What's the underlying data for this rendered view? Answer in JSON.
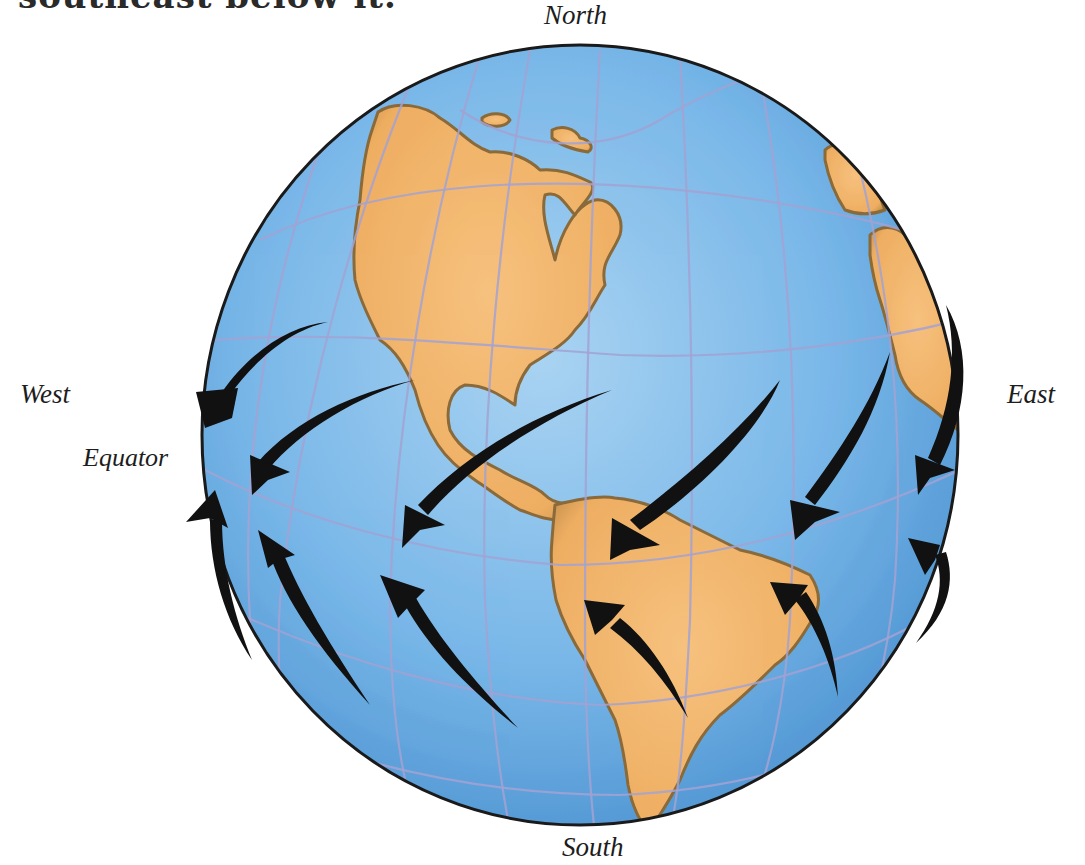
{
  "caption": {
    "top_text_fragment": "southeast below it."
  },
  "labels": {
    "north": "North",
    "south": "South",
    "west": "West",
    "east": "East",
    "equator": "Equator"
  },
  "globe": {
    "center": [
      580,
      435
    ],
    "radius_x": 378,
    "radius_y": 390,
    "ocean_color": "#6aaee3",
    "ocean_light_color": "#9ccbef",
    "land_color": "#f0b46a",
    "land_shade_color": "#8a6a3a",
    "grid_color": "#9c9ccc",
    "outline_color": "#1a1a1a",
    "continents": [
      "North America",
      "Central America",
      "South America",
      "Africa",
      "Greenland/Arctic islands"
    ]
  },
  "arrows": {
    "color": "#111111",
    "northern_hemisphere_direction": "northeast to southwest (toward equator)",
    "southern_hemisphere_direction": "southeast to northwest (toward equator)",
    "northern_count": 6,
    "southern_count": 6
  }
}
